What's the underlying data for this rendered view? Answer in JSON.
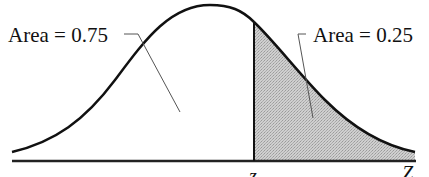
{
  "diagram": {
    "type": "normal-distribution-shaded-tail",
    "left_region": {
      "label": "Area = 0.75",
      "area": 0.75,
      "shaded": false
    },
    "right_region": {
      "label": "Area = 0.25",
      "area": 0.25,
      "shaded": true
    },
    "cutoff_label": "z",
    "axis_label": "Z",
    "colors": {
      "curve": "#111111",
      "axis": "#222222",
      "shade": "#c4c4c4",
      "leader": "#555555",
      "background": "#ffffff"
    }
  }
}
